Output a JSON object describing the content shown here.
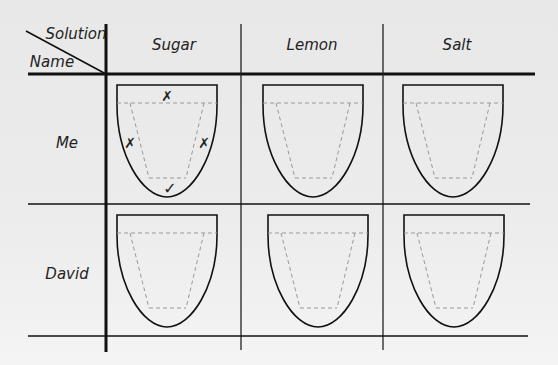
{
  "table": {
    "corner": {
      "top_label": "Solution",
      "bottom_label": "Name"
    },
    "columns": [
      "Sugar",
      "Lemon",
      "Salt"
    ],
    "rows": [
      {
        "name": "Me",
        "cells": [
          {
            "solution": "Sugar",
            "marks": {
              "tip": "✗",
              "left_side": "✗",
              "right_side": "✗",
              "back": "✓"
            }
          },
          {
            "solution": "Lemon",
            "marks": {}
          },
          {
            "solution": "Salt",
            "marks": {}
          }
        ]
      },
      {
        "name": "David",
        "cells": [
          {
            "solution": "Sugar",
            "marks": {}
          },
          {
            "solution": "Lemon",
            "marks": {}
          },
          {
            "solution": "Salt",
            "marks": {}
          }
        ]
      }
    ]
  },
  "colors": {
    "line": "#111111",
    "dashed": "#999999",
    "background": "#ececec"
  }
}
